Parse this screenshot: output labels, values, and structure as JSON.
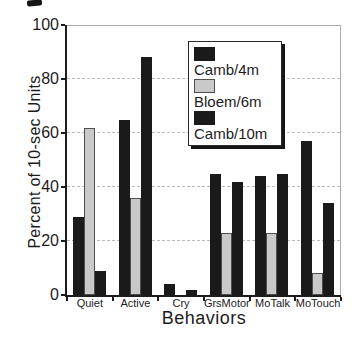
{
  "chart_data": {
    "type": "bar",
    "title": "",
    "xlabel": "Behaviors",
    "ylabel": "Percent of 10-sec Units",
    "ylim": [
      0,
      100
    ],
    "yticks": [
      0,
      20,
      40,
      60,
      80,
      100
    ],
    "grid": "horizontal-dashed",
    "legend_position": "inside-top-center",
    "categories": [
      "Quiet",
      "Active",
      "Cry",
      "GrsMotor",
      "MoTalk",
      "MoTouch"
    ],
    "series": [
      {
        "name": "Camb/4m",
        "color": "#1a1a1a",
        "outlined": false,
        "values": [
          29,
          65,
          4,
          45,
          44,
          57
        ]
      },
      {
        "name": "Bloem/6m",
        "color": "#c9c9c9",
        "outlined": true,
        "values": [
          62,
          36,
          0,
          23,
          23,
          8
        ]
      },
      {
        "name": "Camb/10m",
        "color": "#1a1a1a",
        "outlined": false,
        "values": [
          9,
          88,
          2,
          42,
          45,
          34
        ]
      }
    ]
  },
  "colors": {
    "axis": "#1c1c1c",
    "grid": "#bdbdbd",
    "frame": "#ababab",
    "legend_border": "#2a2a2a",
    "legend_shadow": "#161616",
    "background": "#ffffff"
  }
}
